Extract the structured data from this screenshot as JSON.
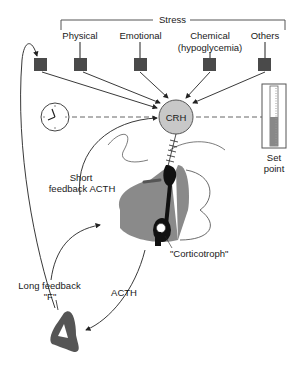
{
  "title": "Stress",
  "stressors": [
    {
      "label": "Physical"
    },
    {
      "label": "Emotional"
    },
    {
      "label": "Chemical",
      "sublabel": "(hypoglycemia)"
    },
    {
      "label": "Others"
    }
  ],
  "hormone_node": {
    "label": "CRH"
  },
  "set_point": {
    "line1": "Set",
    "line2": "point"
  },
  "short_feedback": {
    "line1": "Short",
    "line2": "feedback ACTH"
  },
  "corticotroph": {
    "label": "\"Corticotroph\""
  },
  "acth": {
    "label": "ACTH"
  },
  "long_feedback": {
    "line1": "Long feedback",
    "line2": "\"F\""
  },
  "icons": [
    "clock-icon",
    "thermometer-set-point-icon",
    "stressor-square-icon",
    "adrenal-gland-icon"
  ],
  "colors": {
    "fill_gray": "#8a8a8a",
    "dark_square": "#4a4a4a",
    "crh_fill": "#c8c8c8",
    "line": "#222222"
  }
}
